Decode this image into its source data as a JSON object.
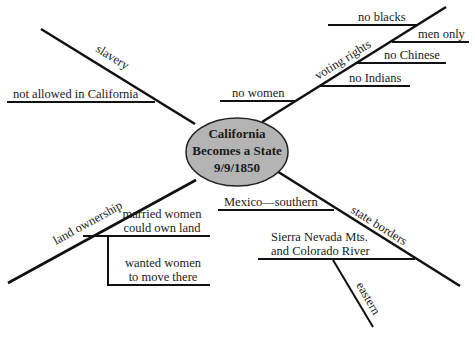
{
  "diagram": {
    "type": "spider-map",
    "center": {
      "line1": "California",
      "line2": "Becomes a State",
      "line3": "9/9/1850",
      "fill": "#b4b4b4"
    },
    "branches": [
      {
        "label": "slavery",
        "details": [
          {
            "text": "not allowed in California"
          }
        ]
      },
      {
        "label": "voting rights",
        "details": [
          {
            "text": "no blacks"
          },
          {
            "text": "men only"
          },
          {
            "text": "no Chinese"
          },
          {
            "text": "no Indians"
          },
          {
            "text": "no women"
          }
        ]
      },
      {
        "label": "land ownership",
        "details": [
          {
            "line1": "married women",
            "line2": "could own land"
          },
          {
            "line1": "wanted women",
            "line2": "to move there"
          }
        ]
      },
      {
        "label": "state borders",
        "details": [
          {
            "text": "Mexico—southern"
          },
          {
            "line1": "Sierra Nevada Mts.",
            "line2": "and Colorado River",
            "sublabel": "eastern"
          }
        ]
      }
    ]
  }
}
